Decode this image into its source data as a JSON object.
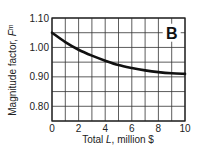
{
  "chart_data": {
    "type": "line",
    "title": "",
    "panel_label": "B",
    "xlabel_prefix": "Total ",
    "xlabel_var": "L",
    "xlabel_suffix": ", million $",
    "ylabel_prefix": "Magnitude factor, ",
    "ylabel_var": "F",
    "ylabel_sub": "m",
    "xlim": [
      0,
      10
    ],
    "ylim": [
      0.75,
      1.1
    ],
    "x_ticks": [
      0,
      2,
      4,
      6,
      8,
      10
    ],
    "x_tick_labels": [
      "0",
      "2",
      "4",
      "6",
      "8",
      "10"
    ],
    "y_ticks": [
      0.8,
      0.9,
      1.0,
      1.1
    ],
    "y_tick_labels": [
      "0.80",
      "0.90",
      "1.00",
      "1.10"
    ],
    "grid": true,
    "x_grid_step": 1,
    "y_grid_step": 0.05,
    "series": [
      {
        "name": "Magnitude factor",
        "x": [
          0,
          1,
          2,
          3,
          4,
          5,
          6,
          7,
          8,
          9,
          10
        ],
        "values": [
          1.05,
          1.018,
          0.992,
          0.972,
          0.955,
          0.94,
          0.93,
          0.922,
          0.916,
          0.912,
          0.91
        ]
      }
    ],
    "legend": "none"
  }
}
